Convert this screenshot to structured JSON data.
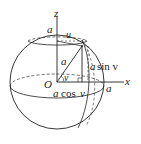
{
  "diagram": {
    "type": "sphere-parametrization",
    "labels": {
      "z_axis": "z",
      "x_axis": "x",
      "origin": "O",
      "radius_top": "a",
      "azimuth": "u",
      "radius_segment": "a",
      "elevation_angle": "v",
      "height_a": "a",
      "height_sin": "sin v",
      "base_a": "a",
      "base_cos": "cos",
      "base_v": "v",
      "x_intercept": "a"
    },
    "colors": {
      "stroke": "#222222",
      "background": "#ffffff"
    }
  }
}
